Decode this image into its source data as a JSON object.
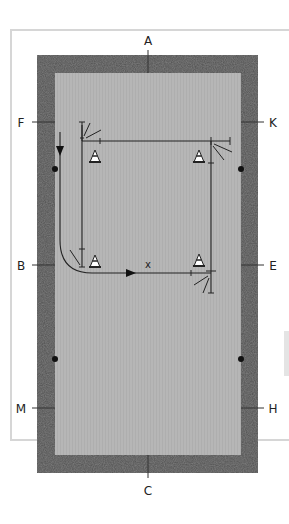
{
  "diagram": {
    "title": "",
    "arena_letters": {
      "top": "A",
      "bottom": "C",
      "left_upper": "F",
      "left_middle": "B",
      "left_lower": "M",
      "right_upper": "K",
      "right_middle": "E",
      "right_lower": "H"
    },
    "center_marker": "x",
    "elements": {
      "cones": 4,
      "riders": 3,
      "track_markers": 4
    },
    "colors": {
      "arena_surface": "#b4b4b4",
      "arena_border": "#5a5a5a",
      "lines": "#222222",
      "frame": "#d6d6d6"
    }
  }
}
